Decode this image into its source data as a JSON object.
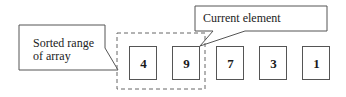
{
  "diagram": {
    "callouts": {
      "sorted_range": "Sorted range\nof array",
      "sorted_range_line1": "Sorted range",
      "sorted_range_line2": "of array",
      "current_element": "Current element"
    },
    "array": {
      "elements": [
        "4",
        "9",
        "7",
        "3",
        "1"
      ],
      "sorted_range_indices": [
        0,
        1
      ],
      "current_index": 1
    }
  }
}
